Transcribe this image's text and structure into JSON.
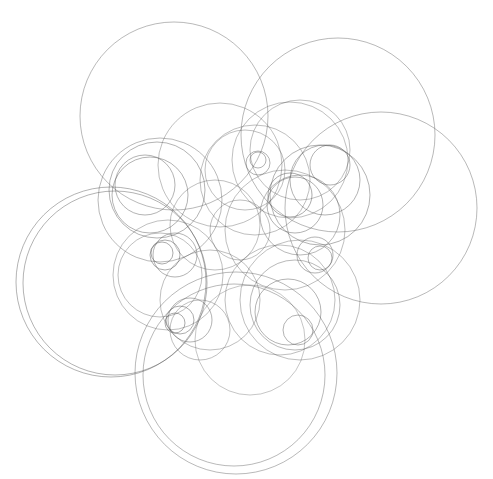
{
  "artwork": {
    "description": "Abstract line drawing of many overlapping thin gray circles on a white background",
    "background": "#ffffff",
    "stroke_color": "#555555",
    "width": 493,
    "height": 479,
    "circles": [
      {
        "cx": 174,
        "cy": 116,
        "r": 94,
        "o": 0.55
      },
      {
        "cx": 338,
        "cy": 135,
        "r": 97,
        "o": 0.55
      },
      {
        "cx": 381,
        "cy": 208,
        "r": 96,
        "o": 0.55
      },
      {
        "cx": 111,
        "cy": 282,
        "r": 95,
        "o": 0.6
      },
      {
        "cx": 115,
        "cy": 283,
        "r": 92,
        "o": 0.6
      },
      {
        "cx": 236,
        "cy": 373,
        "r": 101,
        "o": 0.55
      },
      {
        "cx": 234,
        "cy": 375,
        "r": 91,
        "o": 0.55
      },
      {
        "cx": 160,
        "cy": 200,
        "r": 62,
        "o": 0.55
      },
      {
        "cx": 157,
        "cy": 190,
        "r": 48,
        "o": 0.6
      },
      {
        "cx": 150,
        "cy": 195,
        "r": 38,
        "o": 0.6
      },
      {
        "cx": 145,
        "cy": 185,
        "r": 30,
        "o": 0.6
      },
      {
        "cx": 220,
        "cy": 165,
        "r": 62,
        "o": 0.5
      },
      {
        "cx": 255,
        "cy": 180,
        "r": 55,
        "o": 0.5
      },
      {
        "cx": 245,
        "cy": 170,
        "r": 40,
        "o": 0.5
      },
      {
        "cx": 290,
        "cy": 160,
        "r": 58,
        "o": 0.5
      },
      {
        "cx": 300,
        "cy": 150,
        "r": 50,
        "o": 0.5
      },
      {
        "cx": 258,
        "cy": 163,
        "r": 12,
        "o": 0.6
      },
      {
        "cx": 258,
        "cy": 160,
        "r": 8,
        "o": 0.6
      },
      {
        "cx": 330,
        "cy": 165,
        "r": 20,
        "o": 0.6
      },
      {
        "cx": 325,
        "cy": 180,
        "r": 35,
        "o": 0.6
      },
      {
        "cx": 320,
        "cy": 195,
        "r": 50,
        "o": 0.6
      },
      {
        "cx": 290,
        "cy": 195,
        "r": 22,
        "o": 0.65
      },
      {
        "cx": 295,
        "cy": 205,
        "r": 28,
        "o": 0.6
      },
      {
        "cx": 300,
        "cy": 215,
        "r": 40,
        "o": 0.55
      },
      {
        "cx": 285,
        "cy": 230,
        "r": 60,
        "o": 0.5
      },
      {
        "cx": 315,
        "cy": 255,
        "r": 18,
        "o": 0.6
      },
      {
        "cx": 320,
        "cy": 258,
        "r": 12,
        "o": 0.6
      },
      {
        "cx": 160,
        "cy": 275,
        "r": 42,
        "o": 0.5
      },
      {
        "cx": 168,
        "cy": 275,
        "r": 55,
        "o": 0.5
      },
      {
        "cx": 165,
        "cy": 255,
        "r": 15,
        "o": 0.65
      },
      {
        "cx": 162,
        "cy": 253,
        "r": 11,
        "o": 0.65
      },
      {
        "cx": 175,
        "cy": 255,
        "r": 22,
        "o": 0.6
      },
      {
        "cx": 210,
        "cy": 300,
        "r": 50,
        "o": 0.5
      },
      {
        "cx": 180,
        "cy": 320,
        "r": 14,
        "o": 0.65
      },
      {
        "cx": 175,
        "cy": 323,
        "r": 10,
        "o": 0.65
      },
      {
        "cx": 190,
        "cy": 320,
        "r": 22,
        "o": 0.6
      },
      {
        "cx": 200,
        "cy": 330,
        "r": 30,
        "o": 0.5
      },
      {
        "cx": 295,
        "cy": 305,
        "r": 45,
        "o": 0.55
      },
      {
        "cx": 288,
        "cy": 312,
        "r": 33,
        "o": 0.6
      },
      {
        "cx": 298,
        "cy": 330,
        "r": 15,
        "o": 0.6
      },
      {
        "cx": 300,
        "cy": 300,
        "r": 60,
        "o": 0.5
      },
      {
        "cx": 280,
        "cy": 300,
        "r": 55,
        "o": 0.5
      },
      {
        "cx": 240,
        "cy": 230,
        "r": 30,
        "o": 0.5
      },
      {
        "cx": 215,
        "cy": 225,
        "r": 45,
        "o": 0.5
      },
      {
        "cx": 250,
        "cy": 340,
        "r": 55,
        "o": 0.45
      }
    ]
  }
}
